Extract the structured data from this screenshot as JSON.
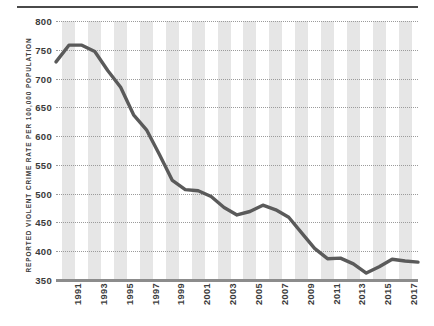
{
  "chart_data": {
    "type": "line",
    "title": "",
    "xlabel": "",
    "ylabel": "REPORTED VIOLENT CRIME RATE PER 100,000 POPULATION",
    "ylim": [
      350,
      800
    ],
    "xlim": [
      1990,
      2018
    ],
    "grid": true,
    "legend": null,
    "line_color": "#5a5a5a",
    "band_color": "#e6e6e6",
    "axis_color": "#8c8c8c",
    "ytick_labels": [
      "800",
      "750",
      "700",
      "650",
      "600",
      "550",
      "500",
      "450",
      "400",
      "350"
    ],
    "ytick_values": [
      800,
      750,
      700,
      650,
      600,
      550,
      500,
      450,
      400,
      350
    ],
    "xtick_labels": [
      "1991",
      "1993",
      "1995",
      "1997",
      "1999",
      "2001",
      "2003",
      "2005",
      "2007",
      "2009",
      "2011",
      "2013",
      "2015",
      "2017"
    ],
    "xtick_values": [
      1991,
      1993,
      1995,
      1997,
      1999,
      2001,
      2003,
      2005,
      2007,
      2009,
      2011,
      2013,
      2015,
      2017
    ],
    "x": [
      1990,
      1991,
      1992,
      1993,
      1994,
      1995,
      1996,
      1997,
      1998,
      1999,
      2000,
      2001,
      2002,
      2003,
      2004,
      2005,
      2006,
      2007,
      2008,
      2009,
      2010,
      2011,
      2012,
      2013,
      2014,
      2015,
      2016,
      2017,
      2018
    ],
    "values": [
      729,
      758,
      758,
      747,
      714,
      685,
      637,
      611,
      568,
      523,
      507,
      505,
      495,
      476,
      463,
      469,
      480,
      472,
      459,
      432,
      405,
      387,
      388,
      378,
      362,
      373,
      386,
      383,
      381
    ]
  }
}
